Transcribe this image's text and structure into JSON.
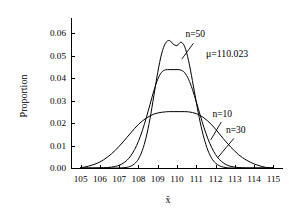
{
  "chart_data": {
    "type": "line",
    "title": "",
    "subtitle": "",
    "xlabel": "x̄",
    "ylabel": "Proportion",
    "xlim": [
      104.5,
      115.5
    ],
    "ylim": [
      0.0,
      0.065
    ],
    "grid": false,
    "legend_position": "inline-annotations",
    "x_ticks": [
      105,
      106,
      107,
      108,
      109,
      110,
      111,
      112,
      113,
      114,
      115
    ],
    "x_tick_labels": [
      "105",
      "106",
      "107",
      "108",
      "109",
      "110",
      "111",
      "112",
      "113",
      "114",
      "115"
    ],
    "y_ticks": [
      0.0,
      0.01,
      0.02,
      0.03,
      0.04,
      0.05,
      0.06
    ],
    "y_tick_labels": [
      "0.00",
      "0.01",
      "0.02",
      "0.03",
      "0.04",
      "0.05",
      "0.06"
    ],
    "annotations": [
      {
        "name": "mu-annotation",
        "text": "μ=110.023",
        "x": 112.6,
        "y": 0.0495
      },
      {
        "name": "n50-label",
        "text": "n=50",
        "x": 110.95,
        "y": 0.0585
      },
      {
        "name": "n10-label",
        "text": "n=10",
        "x": 112.35,
        "y": 0.0228
      },
      {
        "name": "n30-label",
        "text": "n=30",
        "x": 113.05,
        "y": 0.0155
      }
    ],
    "leader_lines": [
      {
        "name": "n50-leader",
        "x1": 110.85,
        "y1": 0.0555,
        "x2": 110.25,
        "y2": 0.0485
      },
      {
        "name": "n10-leader",
        "x1": 112.3,
        "y1": 0.0205,
        "x2": 111.75,
        "y2": 0.0125
      },
      {
        "name": "n30-leader",
        "x1": 112.95,
        "y1": 0.0132,
        "x2": 112.1,
        "y2": 0.0045
      }
    ],
    "x": [
      105.0,
      105.2,
      105.4,
      105.6,
      105.8,
      106.0,
      106.2,
      106.4,
      106.6,
      106.8,
      107.0,
      107.2,
      107.4,
      107.6,
      107.8,
      108.0,
      108.2,
      108.4,
      108.6,
      108.8,
      109.0,
      109.2,
      109.4,
      109.6,
      109.8,
      110.0,
      110.2,
      110.4,
      110.6,
      110.8,
      111.0,
      111.2,
      111.4,
      111.6,
      111.8,
      112.0,
      112.2,
      112.4,
      112.6,
      112.8,
      113.0,
      113.2,
      113.4,
      113.6,
      113.8,
      114.0,
      114.2,
      114.4,
      114.6,
      114.8,
      115.0
    ],
    "series": [
      {
        "name": "n=10",
        "label": "n=10",
        "peak_x": 110.023,
        "peak_y": 0.0251,
        "values": [
          0.0002,
          0.0004,
          0.0008,
          0.0013,
          0.0019,
          0.0027,
          0.0037,
          0.0049,
          0.0063,
          0.0079,
          0.0097,
          0.0116,
          0.0136,
          0.0156,
          0.0176,
          0.0194,
          0.0209,
          0.0222,
          0.0232,
          0.024,
          0.0245,
          0.0248,
          0.025,
          0.0251,
          0.0251,
          0.0251,
          0.0251,
          0.0251,
          0.025,
          0.0247,
          0.0242,
          0.0234,
          0.0223,
          0.0209,
          0.0192,
          0.0173,
          0.0152,
          0.0131,
          0.0111,
          0.0092,
          0.0075,
          0.0059,
          0.0046,
          0.0035,
          0.0026,
          0.0018,
          0.0012,
          0.0007,
          0.0003,
          0.0001,
          0.0
        ]
      },
      {
        "name": "n=30",
        "label": "n=30",
        "peak_x": 110.023,
        "peak_y": 0.0438,
        "values": [
          0.0,
          0.0,
          0.0,
          0.0,
          0.0,
          0.0001,
          0.0001,
          0.0002,
          0.0004,
          0.0007,
          0.0012,
          0.0021,
          0.0034,
          0.0054,
          0.0082,
          0.0119,
          0.0166,
          0.0222,
          0.0283,
          0.0344,
          0.0395,
          0.0426,
          0.0437,
          0.0438,
          0.0438,
          0.0438,
          0.0436,
          0.0424,
          0.0395,
          0.035,
          0.0295,
          0.0236,
          0.018,
          0.0131,
          0.0091,
          0.006,
          0.0038,
          0.0023,
          0.0013,
          0.0007,
          0.0004,
          0.0002,
          0.0001,
          0.0,
          0.0,
          0.0,
          0.0,
          0.0,
          0.0,
          0.0,
          0.0
        ]
      },
      {
        "name": "n=50",
        "label": "n=50",
        "peak_x": 110.023,
        "peak_y": 0.057,
        "values": [
          0.0,
          0.0,
          0.0,
          0.0,
          0.0,
          0.0,
          0.0,
          0.0,
          0.0,
          0.0,
          0.0,
          0.0001,
          0.0003,
          0.0008,
          0.0019,
          0.004,
          0.0078,
          0.0137,
          0.022,
          0.0322,
          0.0425,
          0.0508,
          0.0555,
          0.0568,
          0.0552,
          0.0545,
          0.056,
          0.054,
          0.0478,
          0.0389,
          0.0293,
          0.0205,
          0.0133,
          0.0079,
          0.0043,
          0.0022,
          0.001,
          0.0004,
          0.0001,
          0.0,
          0.0,
          0.0,
          0.0,
          0.0,
          0.0,
          0.0,
          0.0,
          0.0,
          0.0,
          0.0,
          0.0
        ]
      }
    ]
  }
}
